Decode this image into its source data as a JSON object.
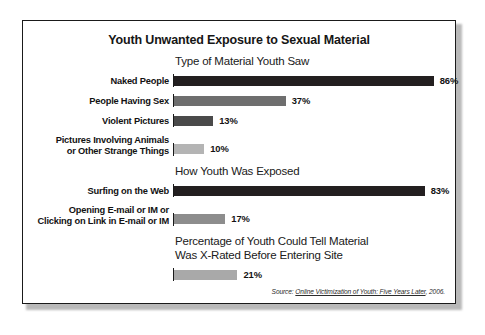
{
  "figure": {
    "title": "Youth Unwanted Exposure to Sexual Material",
    "source_prefix": "Source:",
    "source_title": "Online Victimization of Youth: Five Years Later",
    "source_year": ", 2006."
  },
  "colors": {
    "bar_dark": "#231f20",
    "bar_mid": "#6e6e6e",
    "bar_dark_gray": "#4a4a4a",
    "bar_light": "#b4b4b4",
    "bar_light2": "#a9a9a9",
    "frame": "#1a1a1a",
    "text": "#121212"
  },
  "sections": [
    {
      "id": "type-of-material",
      "header": "Type of Material Youth Saw",
      "rows": [
        {
          "label_lines": [
            "Naked People"
          ],
          "value": 86,
          "value_label": "86%",
          "shade": "#231f20"
        },
        {
          "label_lines": [
            "People Having Sex"
          ],
          "value": 37,
          "value_label": "37%",
          "shade": "#6e6e6e"
        },
        {
          "label_lines": [
            "Violent Pictures"
          ],
          "value": 13,
          "value_label": "13%",
          "shade": "#4a4a4a"
        },
        {
          "label_lines": [
            "Pictures Involving Animals",
            "or Other Strange Things"
          ],
          "value": 10,
          "value_label": "10%",
          "shade": "#b4b4b4"
        }
      ]
    },
    {
      "id": "how-exposed",
      "header": "How Youth Was Exposed",
      "rows": [
        {
          "label_lines": [
            "Surfing on the Web"
          ],
          "value": 83,
          "value_label": "83%",
          "shade": "#231f20"
        },
        {
          "label_lines": [
            "Opening E-mail or IM or",
            "Clicking on Link in E-mail or IM"
          ],
          "value": 17,
          "value_label": "17%",
          "shade": "#8d8d8d"
        }
      ]
    },
    {
      "id": "could-tell-x-rated",
      "header_lines": [
        "Percentage of Youth Could Tell Material",
        "Was X-Rated Before Entering Site"
      ],
      "rows": [
        {
          "label_lines": [
            ""
          ],
          "value": 21,
          "value_label": "21%",
          "shade": "#a9a9a9"
        }
      ]
    }
  ],
  "chart_data": {
    "type": "bar",
    "orientation": "horizontal",
    "title": "Youth Unwanted Exposure to Sexual Material",
    "xlabel": "",
    "ylabel": "",
    "xlim": [
      0,
      100
    ],
    "unit": "%",
    "grid": false,
    "legend": "none",
    "annotation": "Source: Online Victimization of Youth: Five Years Later, 2006.",
    "panels": [
      {
        "title": "Type of Material Youth Saw",
        "categories": [
          "Naked People",
          "People Having Sex",
          "Violent Pictures",
          "Pictures Involving Animals or Other Strange Things"
        ],
        "values": [
          86,
          37,
          13,
          10
        ]
      },
      {
        "title": "How Youth Was Exposed",
        "categories": [
          "Surfing on the Web",
          "Opening E-mail or IM or Clicking on Link in E-mail or IM"
        ],
        "values": [
          83,
          17
        ]
      },
      {
        "title": "Percentage of Youth Could Tell Material Was X-Rated Before Entering Site",
        "categories": [
          ""
        ],
        "values": [
          21
        ]
      }
    ]
  }
}
